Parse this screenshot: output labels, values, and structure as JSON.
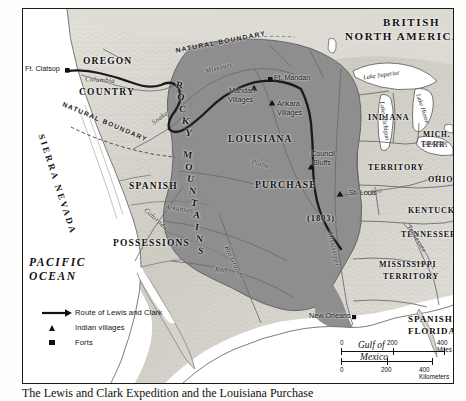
{
  "map": {
    "title": "Route of Lewis and Clark across the Louisiana Purchase",
    "countries": [
      {
        "name": "british-north-america",
        "label_line1": "BRITISH",
        "label_line2": "NORTH AMERICA"
      }
    ],
    "regions": [
      {
        "name": "oregon-country",
        "line1": "OREGON",
        "line2": "COUNTRY"
      },
      {
        "name": "spanish-possessions",
        "line1": "SPANISH",
        "line2": "POSSESSIONS"
      },
      {
        "name": "louisiana-purchase",
        "line1": "LOUISIANA",
        "line2": "PURCHASE",
        "line3": "(1803)"
      },
      {
        "name": "indiana-territory",
        "line1": "INDIANA",
        "line2": "TERRITORY"
      },
      {
        "name": "michigan-territory",
        "line1": "MICH.",
        "line2": "TERR."
      },
      {
        "name": "mississippi-territory",
        "line1": "MISSISSIPPI",
        "line2": "TERRITORY"
      },
      {
        "name": "spanish-florida",
        "line1": "SPANISH",
        "line2": "FLORIDA"
      },
      {
        "name": "ohio",
        "line1": "OHIO"
      },
      {
        "name": "kentucky",
        "line1": "KENTUCKY"
      },
      {
        "name": "tennessee",
        "line1": "TENNESSEE"
      },
      {
        "name": "georgia",
        "line1": "GA."
      }
    ],
    "oceans": [
      {
        "name": "pacific-ocean",
        "line1": "PACIFIC",
        "line2": "OCEAN"
      },
      {
        "name": "gulf-of-mexico",
        "line1": "Gulf of",
        "line2": "Mexico"
      }
    ],
    "mountains": [
      {
        "name": "rocky-mountains",
        "word1": "ROCKY",
        "word2": "MOUNTAINS"
      },
      {
        "name": "sierra-nevada",
        "word1": "SIERRA NEVADA"
      }
    ],
    "rivers": [
      {
        "name": "missouri-river",
        "label": "Missouri"
      },
      {
        "name": "columbia-river",
        "label": "Columbia"
      },
      {
        "name": "snake-river",
        "label": "Snake"
      },
      {
        "name": "platte-river",
        "label": "Platte"
      },
      {
        "name": "arkansas-river",
        "label": "Arkansas"
      },
      {
        "name": "red-river",
        "label": "Red"
      },
      {
        "name": "rio-grande-river",
        "label": "Rio Grande"
      },
      {
        "name": "colorado-river",
        "label": "Colorado"
      },
      {
        "name": "mississippi-river",
        "label": "Mississippi"
      },
      {
        "name": "ohio-river",
        "label": "Ohio"
      },
      {
        "name": "tennessee-river",
        "label": "Tennessee"
      }
    ],
    "lakes": [
      {
        "name": "lake-superior",
        "label": "Lake Superior"
      },
      {
        "name": "lake-michigan",
        "label": "Lake Michigan"
      },
      {
        "name": "lake-huron",
        "label": "Lake Huron"
      },
      {
        "name": "lake-erie",
        "label": "Lake Erie"
      }
    ],
    "boundaries": [
      {
        "name": "natural-boundary-north",
        "label": "NATURAL BOUNDARY"
      },
      {
        "name": "natural-boundary-west",
        "label": "NATURAL BOUNDARY"
      }
    ],
    "places": [
      {
        "name": "ft-clatsop",
        "label": "Ft. Clatsop",
        "symbol": "fort"
      },
      {
        "name": "ft-mandan",
        "label": "Ft. Mandan",
        "symbol": "fort"
      },
      {
        "name": "mandan-villages",
        "line1": "Mandan",
        "line2": "Villages",
        "symbol": "village"
      },
      {
        "name": "arikara-villages",
        "line1": "Arikara",
        "line2": "Villages",
        "symbol": "village"
      },
      {
        "name": "council-bluffs",
        "line1": "Council",
        "line2": "Bluffs",
        "symbol": "village"
      },
      {
        "name": "st-louis",
        "label": "St. Louis",
        "symbol": "village"
      },
      {
        "name": "new-orleans",
        "label": "New Orleans",
        "symbol": "village"
      }
    ]
  },
  "legend": {
    "items": [
      {
        "name": "route",
        "symbol": "arrow",
        "label": "Route of Lewis and Clark"
      },
      {
        "name": "indian-villages",
        "symbol": "triangle",
        "label": "Indian villages"
      },
      {
        "name": "forts",
        "symbol": "square",
        "label": "Forts"
      }
    ]
  },
  "scale": {
    "miles": {
      "ticks": [
        "0",
        "200",
        "400"
      ],
      "unit": "400 Miles",
      "zero": "0",
      "mid": "200"
    },
    "kilometers": {
      "zero": "0",
      "mid": "200",
      "unit": "400 Kilometers"
    }
  },
  "caption": {
    "text": "The Lewis and Clark Expedition and the Louisiana Purchase"
  },
  "colors": {
    "purchase_fill": "#8e8e8e",
    "land_fill": "#d8d6d0",
    "water": "#ffffff",
    "ink": "#111111",
    "route": "#1a1a1a"
  }
}
